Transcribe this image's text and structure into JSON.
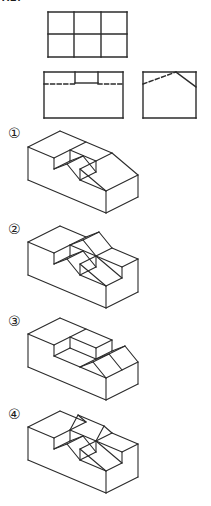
{
  "page": {
    "background": "#ffffff",
    "line_color": "#2b2b2b",
    "header_fragment": "X2."
  },
  "option_labels": [
    {
      "text": "①"
    },
    {
      "text": "②"
    },
    {
      "text": "③"
    },
    {
      "text": "④"
    }
  ],
  "figures": [
    {
      "id": "top-view",
      "desc": "plan view: rectangle divided into 3x2 grid of squares",
      "lines": [
        [
          48,
          12,
          127,
          12
        ],
        [
          127,
          12,
          127,
          57
        ],
        [
          48,
          57,
          127,
          57
        ],
        [
          48,
          12,
          48,
          57
        ],
        [
          74,
          12,
          74,
          57
        ],
        [
          101,
          12,
          101,
          57
        ],
        [
          48,
          34,
          127,
          34
        ]
      ]
    },
    {
      "id": "front-view",
      "desc": "front view: rectangle with small notch at top middle and hidden dashed edge",
      "lines": [
        [
          44,
          72,
          123,
          72
        ],
        [
          123,
          72,
          123,
          118
        ],
        [
          44,
          118,
          123,
          118
        ],
        [
          44,
          72,
          44,
          118
        ],
        [
          75,
          72,
          75,
          83
        ],
        [
          98,
          72,
          98,
          83
        ],
        [
          75,
          83,
          98,
          83
        ],
        [
          44,
          84,
          75,
          84,
          "d"
        ],
        [
          98,
          84,
          123,
          84,
          "d"
        ]
      ]
    },
    {
      "id": "side-view",
      "desc": "side view: rectangle with roof peak, hidden dashed slope on left",
      "lines": [
        [
          143,
          72,
          196,
          72
        ],
        [
          196,
          72,
          196,
          118
        ],
        [
          143,
          118,
          196,
          118
        ],
        [
          143,
          72,
          143,
          118
        ],
        [
          176,
          72,
          196,
          87
        ],
        [
          143,
          84,
          176,
          72,
          "d"
        ]
      ]
    },
    {
      "id": "option-1",
      "desc": "isometric solid: block with notched groove containing a wedge prism and right slope",
      "lines": [
        [
          28,
          147,
          60,
          131
        ],
        [
          60,
          131,
          112,
          153
        ],
        [
          112,
          153,
          138,
          175
        ],
        [
          138,
          175,
          138,
          197
        ],
        [
          138,
          197,
          106,
          213
        ],
        [
          106,
          213,
          28,
          180
        ],
        [
          28,
          180,
          28,
          147
        ],
        [
          28,
          147,
          54,
          158
        ],
        [
          86,
          142,
          54,
          158
        ],
        [
          54,
          158,
          54,
          169
        ],
        [
          54,
          169,
          70,
          161
        ],
        [
          70,
          150,
          70,
          161
        ],
        [
          70,
          150,
          96,
          161
        ],
        [
          96,
          161,
          96,
          172
        ],
        [
          80,
          169,
          80,
          180
        ],
        [
          80,
          180,
          96,
          172
        ],
        [
          67,
          164,
          83,
          156
        ],
        [
          54,
          169,
          67,
          164
        ],
        [
          67,
          164,
          80,
          180
        ],
        [
          83,
          156,
          70,
          161
        ],
        [
          83,
          156,
          96,
          172
        ],
        [
          80,
          169,
          112,
          153
        ],
        [
          80,
          169,
          106,
          191
        ],
        [
          80,
          180,
          106,
          191
        ],
        [
          106,
          191,
          138,
          175
        ],
        [
          106,
          191,
          106,
          213
        ]
      ]
    },
    {
      "id": "option-2",
      "desc": "isometric solid: like option 1 plus ridge roof running front-to-back on rear middle cell",
      "lines": [
        [
          28,
          242,
          60,
          226
        ],
        [
          60,
          226,
          86,
          237
        ],
        [
          86,
          237,
          99,
          232
        ],
        [
          99,
          232,
          112,
          248
        ],
        [
          112,
          248,
          138,
          259
        ],
        [
          138,
          259,
          138,
          292
        ],
        [
          138,
          292,
          106,
          308
        ],
        [
          106,
          308,
          28,
          275
        ],
        [
          28,
          275,
          28,
          242
        ],
        [
          28,
          242,
          54,
          253
        ],
        [
          86,
          237,
          54,
          253
        ],
        [
          54,
          253,
          54,
          264
        ],
        [
          54,
          264,
          70,
          256
        ],
        [
          70,
          245,
          70,
          256
        ],
        [
          70,
          245,
          96,
          256
        ],
        [
          96,
          256,
          96,
          267
        ],
        [
          80,
          264,
          80,
          275
        ],
        [
          80,
          275,
          96,
          267
        ],
        [
          67,
          259,
          83,
          251
        ],
        [
          54,
          264,
          67,
          259
        ],
        [
          67,
          259,
          80,
          275
        ],
        [
          83,
          251,
          70,
          256
        ],
        [
          83,
          251,
          96,
          267
        ],
        [
          70,
          245,
          83,
          240
        ],
        [
          83,
          240,
          99,
          232
        ],
        [
          83,
          240,
          96,
          256
        ],
        [
          80,
          264,
          112,
          248
        ],
        [
          80,
          264,
          106,
          286
        ],
        [
          80,
          275,
          106,
          286
        ],
        [
          106,
          286,
          122,
          278
        ],
        [
          96,
          256,
          122,
          278
        ],
        [
          96,
          256,
          122,
          267
        ],
        [
          122,
          267,
          122,
          278
        ],
        [
          122,
          267,
          138,
          259
        ],
        [
          106,
          286,
          106,
          308
        ]
      ]
    },
    {
      "id": "option-3",
      "desc": "isometric solid: rectangular empty groove, flat raised blocks and full roof sloping to the right end",
      "lines": [
        [
          28,
          334,
          60,
          318
        ],
        [
          60,
          318,
          112,
          340
        ],
        [
          112,
          340,
          112,
          351
        ],
        [
          112,
          351,
          125,
          346
        ],
        [
          125,
          346,
          138,
          362
        ],
        [
          138,
          362,
          138,
          384
        ],
        [
          138,
          384,
          106,
          400
        ],
        [
          106,
          400,
          28,
          367
        ],
        [
          28,
          367,
          28,
          334
        ],
        [
          28,
          334,
          54,
          345
        ],
        [
          86,
          329,
          54,
          345
        ],
        [
          54,
          345,
          54,
          356
        ],
        [
          54,
          356,
          70,
          348
        ],
        [
          70,
          337,
          70,
          348
        ],
        [
          70,
          337,
          96,
          348
        ],
        [
          96,
          348,
          96,
          359
        ],
        [
          54,
          356,
          80,
          367
        ],
        [
          70,
          348,
          96,
          359
        ],
        [
          96,
          348,
          112,
          340
        ],
        [
          80,
          367,
          112,
          351
        ],
        [
          93,
          362,
          125,
          346
        ],
        [
          80,
          367,
          93,
          362
        ],
        [
          93,
          362,
          106,
          378
        ],
        [
          80,
          367,
          106,
          378
        ],
        [
          106,
          378,
          138,
          362
        ],
        [
          96,
          359,
          109,
          354
        ],
        [
          109,
          354,
          122,
          370
        ],
        [
          106,
          378,
          106,
          400
        ]
      ]
    },
    {
      "id": "option-4",
      "desc": "isometric solid: like option 2 but rear-middle roof ridge runs left-to-right, poking above back edge",
      "lines": [
        [
          28,
          427,
          60,
          411
        ],
        [
          60,
          411,
          86,
          422
        ],
        [
          86,
          422,
          78,
          415
        ],
        [
          78,
          415,
          104,
          426
        ],
        [
          104,
          426,
          112,
          433
        ],
        [
          112,
          433,
          138,
          444
        ],
        [
          138,
          444,
          138,
          477
        ],
        [
          138,
          477,
          106,
          493
        ],
        [
          106,
          493,
          28,
          460
        ],
        [
          28,
          460,
          28,
          427
        ],
        [
          28,
          427,
          54,
          438
        ],
        [
          86,
          422,
          54,
          438
        ],
        [
          54,
          438,
          54,
          449
        ],
        [
          54,
          449,
          70,
          441
        ],
        [
          70,
          430,
          70,
          441
        ],
        [
          70,
          430,
          96,
          441
        ],
        [
          96,
          441,
          96,
          452
        ],
        [
          80,
          449,
          80,
          460
        ],
        [
          80,
          460,
          96,
          452
        ],
        [
          67,
          444,
          83,
          436
        ],
        [
          54,
          449,
          67,
          444
        ],
        [
          67,
          444,
          80,
          460
        ],
        [
          83,
          436,
          70,
          441
        ],
        [
          83,
          436,
          96,
          452
        ],
        [
          70,
          430,
          78,
          415
        ],
        [
          96,
          441,
          104,
          426
        ],
        [
          80,
          449,
          112,
          433
        ],
        [
          80,
          449,
          106,
          471
        ],
        [
          80,
          460,
          106,
          471
        ],
        [
          106,
          471,
          122,
          463
        ],
        [
          96,
          441,
          122,
          463
        ],
        [
          96,
          441,
          122,
          452
        ],
        [
          122,
          452,
          122,
          463
        ],
        [
          122,
          452,
          138,
          444
        ],
        [
          106,
          471,
          106,
          493
        ]
      ]
    }
  ]
}
